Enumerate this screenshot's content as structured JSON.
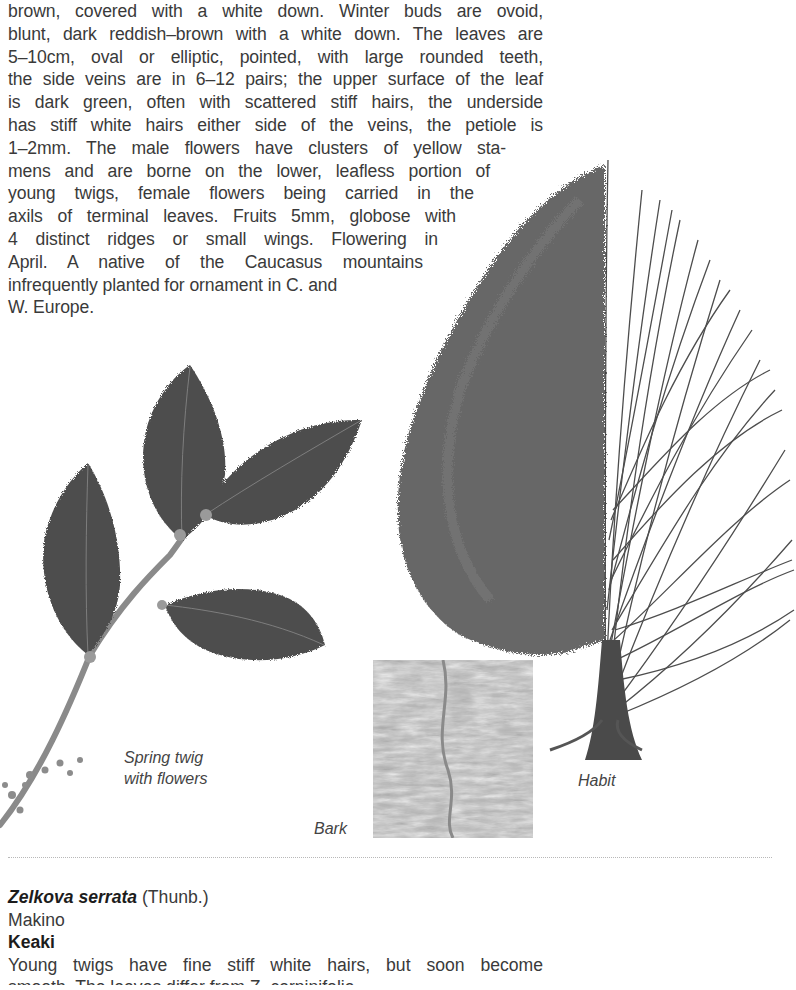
{
  "description": {
    "lines": [
      "brown, covered with a white down. Winter buds are ovoid,",
      "blunt, dark reddish–brown with a white down. The leaves are",
      "5–10cm, oval or elliptic, pointed, with large rounded teeth,",
      "the side veins are in 6–12 pairs; the upper surface of the leaf",
      "is dark green, often with scattered stiff hairs, the underside",
      "has stiff white hairs either side of the veins, the petiole is",
      "1–2mm. The male flowers have clusters of yellow sta-",
      "mens and are borne on the lower, leafless portion of",
      "young twigs, female flowers being carried in the",
      "axils of terminal leaves. Fruits 5mm, globose with",
      "4 distinct ridges or small wings. Flowering in",
      "April. A native of the Caucasus mountains",
      "infrequently planted for ornament in C. and",
      "W. Europe."
    ]
  },
  "illustrations": {
    "twig_caption_line1": "Spring twig",
    "twig_caption_line2": "with flowers",
    "bark_caption": "Bark",
    "habit_caption": "Habit"
  },
  "next_entry": {
    "scientific_name": "Zelkova serrata",
    "author_part1": " (Thunb.)",
    "author_part2": "Makino",
    "common_name": "Keaki",
    "text_line1": "Young twigs have fine stiff white hairs, but soon become",
    "text_line2_partial": "smooth. The leaves differ from Z. carpinifolia"
  }
}
